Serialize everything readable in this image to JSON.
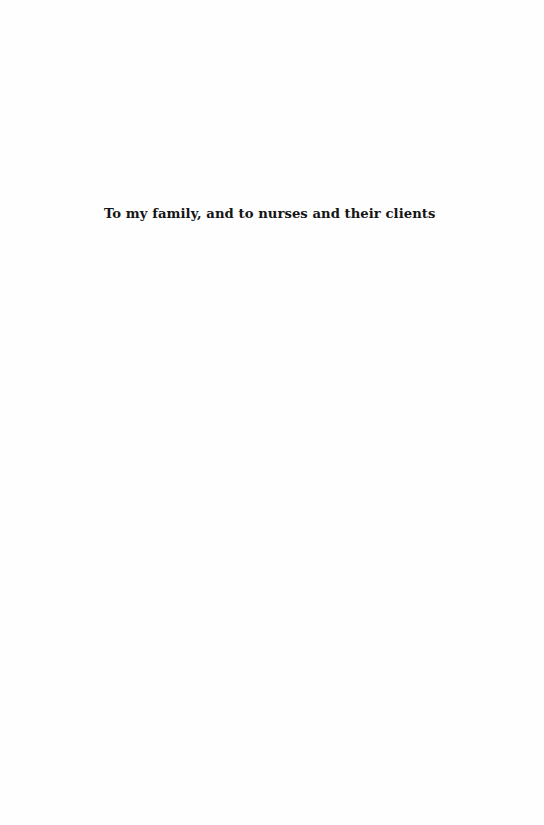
{
  "page": {
    "type": "dedication",
    "dedication_text": "To my family, and to nurses and their clients"
  }
}
